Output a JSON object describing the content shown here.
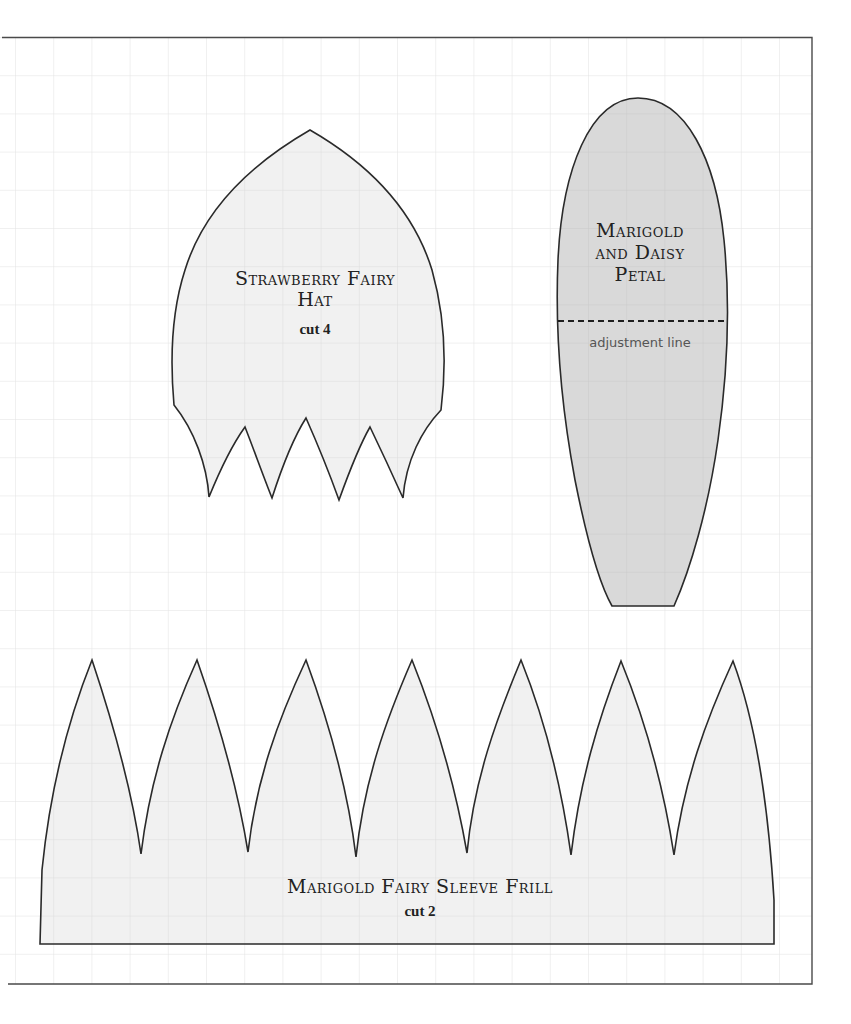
{
  "page": {
    "background": "#ffffff",
    "grid_color": "#e3e3e3",
    "border_color": "#555555",
    "outline_color": "#222222"
  },
  "patterns": {
    "hat": {
      "title": "Strawberry Fairy Hat",
      "title_line1": "Strawberry Fairy",
      "title_line2": "Hat",
      "instruction": "cut 4",
      "fill": "#f1f1f1"
    },
    "petal": {
      "title": "Marigold and Daisy Petal",
      "title_line1": "Marigold",
      "title_line2": "and Daisy",
      "title_line3": "Petal",
      "adjustment_label": "adjustment line",
      "fill": "#dadada"
    },
    "frill": {
      "title": "Marigold Fairy Sleeve Frill",
      "instruction": "cut 2",
      "fill": "#f1f1f1"
    }
  }
}
